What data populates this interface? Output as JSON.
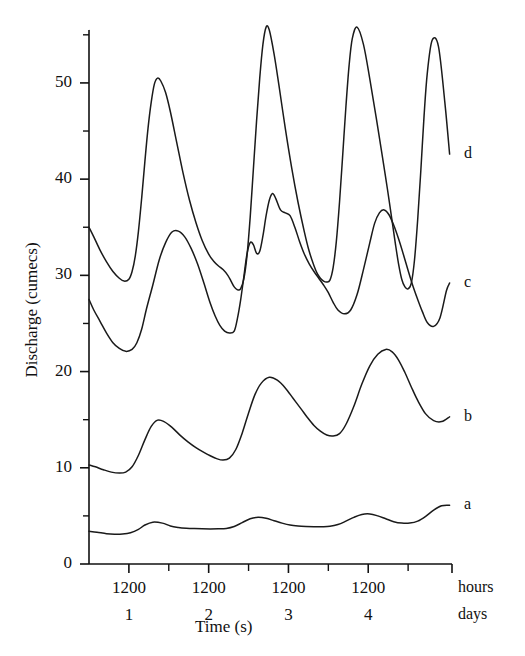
{
  "chart_data": {
    "type": "line",
    "title": "",
    "xlabel": "Time (s)",
    "ylabel": "Discharge (cumecs)",
    "ylim": [
      0,
      55.5
    ],
    "xlim": [
      0,
      4.55
    ],
    "grid": false,
    "legend_position": "right-end-of-curve",
    "y_major_ticks": [
      0,
      10,
      20,
      30,
      40,
      50
    ],
    "y_minor_ticks": [
      5,
      15,
      25,
      35,
      45,
      55
    ],
    "y_tick_labels": [
      "0",
      "10",
      "20",
      "30",
      "40",
      "50"
    ],
    "x_major_ticks": [
      0.5,
      1.5,
      2.5,
      3.5
    ],
    "x_minor_ticks": [
      1.0,
      2.0,
      3.0,
      4.0
    ],
    "x_tick_labels": [
      "1200",
      "1200",
      "1200",
      "1200"
    ],
    "x_row_labels": [
      "hours",
      "days"
    ],
    "x_day_labels": [
      "1",
      "2",
      "3",
      "4"
    ],
    "x_day_positions": [
      0.5,
      1.5,
      2.5,
      3.5
    ],
    "series": [
      {
        "name": "a",
        "label": "a",
        "x": [
          0.0,
          0.1,
          0.22,
          0.32,
          0.42,
          0.52,
          0.62,
          0.7,
          0.8,
          0.92,
          1.02,
          1.12,
          1.22,
          1.32,
          1.42,
          1.52,
          1.62,
          1.72,
          1.82,
          1.92,
          2.02,
          2.12,
          2.22,
          2.32,
          2.42,
          2.52,
          2.62,
          2.72,
          2.82,
          2.92,
          3.02,
          3.12,
          3.22,
          3.32,
          3.42,
          3.52,
          3.62,
          3.72,
          3.82,
          3.92,
          4.02,
          4.12,
          4.22,
          4.32,
          4.42,
          4.52
        ],
        "y": [
          3.4,
          3.3,
          3.15,
          3.1,
          3.12,
          3.25,
          3.6,
          4.05,
          4.35,
          4.25,
          3.95,
          3.8,
          3.72,
          3.68,
          3.66,
          3.65,
          3.66,
          3.7,
          3.9,
          4.3,
          4.7,
          4.85,
          4.75,
          4.5,
          4.25,
          4.05,
          3.95,
          3.9,
          3.88,
          3.88,
          3.92,
          4.1,
          4.45,
          4.85,
          5.15,
          5.2,
          5.0,
          4.7,
          4.4,
          4.25,
          4.25,
          4.45,
          4.95,
          5.6,
          6.05,
          6.1
        ]
      },
      {
        "name": "b",
        "label": "b",
        "x": [
          0.0,
          0.08,
          0.18,
          0.28,
          0.38,
          0.46,
          0.54,
          0.62,
          0.7,
          0.78,
          0.86,
          0.94,
          1.04,
          1.14,
          1.24,
          1.34,
          1.44,
          1.52,
          1.6,
          1.68,
          1.76,
          1.84,
          1.92,
          2.0,
          2.08,
          2.16,
          2.26,
          2.36,
          2.46,
          2.56,
          2.66,
          2.74,
          2.82,
          2.9,
          2.98,
          3.06,
          3.14,
          3.22,
          3.32,
          3.42,
          3.52,
          3.62,
          3.72,
          3.8,
          3.88,
          3.96,
          4.04,
          4.12,
          4.22,
          4.32,
          4.42,
          4.52
        ],
        "y": [
          10.3,
          10.1,
          9.8,
          9.55,
          9.45,
          9.55,
          10.1,
          11.3,
          12.9,
          14.3,
          14.95,
          14.8,
          14.2,
          13.4,
          12.7,
          12.1,
          11.6,
          11.25,
          10.95,
          10.8,
          11.0,
          11.9,
          13.6,
          15.7,
          17.6,
          18.8,
          19.4,
          19.1,
          18.3,
          17.2,
          16.1,
          15.2,
          14.4,
          13.8,
          13.4,
          13.3,
          13.55,
          14.5,
          16.4,
          18.7,
          20.6,
          21.8,
          22.3,
          22.05,
          21.2,
          19.9,
          18.4,
          17.0,
          15.6,
          14.9,
          14.8,
          15.3
        ]
      },
      {
        "name": "c",
        "label": "c",
        "x": [
          0.0,
          0.06,
          0.14,
          0.22,
          0.3,
          0.38,
          0.46,
          0.54,
          0.6,
          0.66,
          0.72,
          0.8,
          0.88,
          0.96,
          1.04,
          1.12,
          1.2,
          1.28,
          1.36,
          1.44,
          1.52,
          1.58,
          1.64,
          1.7,
          1.76,
          1.82,
          1.86,
          1.9,
          1.94,
          1.98,
          2.02,
          2.06,
          2.1,
          2.14,
          2.18,
          2.22,
          2.26,
          2.3,
          2.34,
          2.4,
          2.46,
          2.52,
          2.58,
          2.64,
          2.7,
          2.76,
          2.82,
          2.88,
          2.94,
          3.0,
          3.06,
          3.12,
          3.2,
          3.28,
          3.36,
          3.44,
          3.52,
          3.58,
          3.64,
          3.7,
          3.76,
          3.82,
          3.88,
          3.94,
          4.0,
          4.06,
          4.12,
          4.18,
          4.24,
          4.32,
          4.4,
          4.48,
          4.52
        ],
        "y": [
          27.5,
          26.4,
          25.2,
          24.0,
          23.0,
          22.4,
          22.1,
          22.3,
          23.0,
          24.4,
          26.5,
          29.0,
          31.6,
          33.4,
          34.5,
          34.6,
          34.0,
          32.8,
          31.2,
          29.2,
          27.1,
          25.8,
          24.8,
          24.2,
          24.0,
          24.2,
          25.5,
          27.4,
          29.8,
          32.2,
          33.4,
          33.2,
          32.3,
          32.5,
          34.1,
          36.2,
          37.8,
          38.5,
          38.0,
          36.8,
          36.5,
          36.2,
          35.0,
          33.5,
          32.2,
          31.2,
          30.4,
          29.7,
          29.0,
          28.2,
          27.2,
          26.4,
          26.0,
          26.4,
          28.0,
          30.6,
          33.4,
          35.4,
          36.5,
          36.8,
          36.3,
          35.2,
          33.8,
          32.2,
          30.5,
          28.9,
          27.5,
          26.2,
          25.1,
          24.7,
          25.6,
          28.4,
          29.2
        ]
      },
      {
        "name": "d",
        "label": "d",
        "x": [
          0.0,
          0.06,
          0.14,
          0.22,
          0.3,
          0.38,
          0.44,
          0.5,
          0.54,
          0.58,
          0.62,
          0.66,
          0.7,
          0.74,
          0.78,
          0.82,
          0.86,
          0.9,
          0.96,
          1.02,
          1.1,
          1.18,
          1.26,
          1.34,
          1.42,
          1.5,
          1.56,
          1.62,
          1.68,
          1.74,
          1.78,
          1.82,
          1.86,
          1.9,
          1.94,
          1.98,
          2.02,
          2.06,
          2.1,
          2.14,
          2.18,
          2.22,
          2.26,
          2.32,
          2.38,
          2.46,
          2.54,
          2.62,
          2.7,
          2.76,
          2.82,
          2.86,
          2.9,
          2.94,
          2.98,
          3.02,
          3.06,
          3.1,
          3.14,
          3.18,
          3.22,
          3.26,
          3.3,
          3.36,
          3.44,
          3.52,
          3.6,
          3.68,
          3.74,
          3.8,
          3.84,
          3.88,
          3.92,
          3.96,
          4.0,
          4.04,
          4.08,
          4.12,
          4.16,
          4.2,
          4.24,
          4.3,
          4.38,
          4.46,
          4.52
        ],
        "y": [
          35.0,
          34.0,
          32.6,
          31.4,
          30.4,
          29.7,
          29.4,
          29.6,
          30.4,
          32.0,
          34.6,
          38.0,
          41.8,
          45.3,
          48.0,
          49.9,
          50.5,
          50.2,
          49.0,
          47.0,
          43.8,
          40.6,
          37.8,
          35.5,
          33.6,
          32.2,
          31.5,
          31.0,
          30.6,
          30.0,
          29.4,
          28.8,
          28.5,
          28.6,
          29.6,
          32.0,
          36.0,
          41.0,
          46.0,
          50.5,
          54.0,
          55.8,
          55.5,
          53.0,
          49.8,
          45.3,
          41.2,
          37.6,
          34.5,
          32.5,
          31.0,
          30.2,
          29.7,
          29.4,
          29.3,
          29.5,
          30.8,
          33.5,
          37.6,
          42.5,
          47.5,
          51.8,
          54.6,
          55.8,
          54.0,
          50.4,
          46.4,
          42.2,
          39.0,
          35.6,
          33.3,
          31.2,
          29.6,
          28.8,
          28.6,
          29.2,
          31.6,
          35.8,
          41.0,
          46.6,
          51.0,
          54.4,
          53.8,
          48.0,
          42.6
        ]
      }
    ]
  },
  "axes": {
    "x_title": "Time (s)",
    "y_title": "Discharge (cumecs)",
    "row_label_hours": "hours",
    "row_label_days": "days"
  }
}
